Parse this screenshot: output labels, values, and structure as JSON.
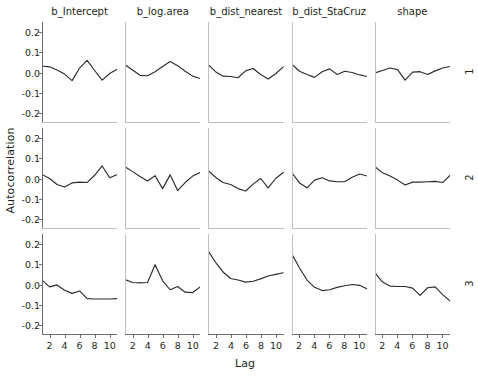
{
  "figure": {
    "ylabel": "Autocorrelation",
    "xlabel": "Lag",
    "line_color": "#2b2b2b",
    "axis_color": "#6d6d6d",
    "background": "#ffffff"
  },
  "axes": {
    "xticks": [
      2,
      4,
      6,
      8,
      10
    ],
    "xtick_labels": [
      "2",
      "4",
      "6",
      "8",
      "10"
    ],
    "xlim": [
      1,
      11
    ],
    "yticks": [
      0.2,
      0.1,
      0.0,
      -0.1,
      -0.2
    ],
    "ytick_labels": [
      "0.2",
      "0.1",
      "0.0",
      "-0.1",
      "-0.2"
    ],
    "ylim": [
      -0.25,
      0.25
    ]
  },
  "columns": [
    {
      "title": "b_Intercept"
    },
    {
      "title": "b_log.area"
    },
    {
      "title": "b_dist_nearest"
    },
    {
      "title": "b_dist_StaCruz"
    },
    {
      "title": "shape"
    }
  ],
  "rows": [
    {
      "label": "1"
    },
    {
      "label": "2"
    },
    {
      "label": "3"
    }
  ],
  "chart_data": {
    "type": "line",
    "title": "",
    "xlabel": "Lag",
    "ylabel": "Autocorrelation",
    "xlim": [
      1,
      11
    ],
    "ylim": [
      -0.25,
      0.25
    ],
    "grid": false,
    "legend": "none",
    "layout": "facet-grid 3 rows x 5 columns",
    "row_labels": [
      "1",
      "2",
      "3"
    ],
    "column_labels": [
      "b_Intercept",
      "b_log.area",
      "b_dist_nearest",
      "b_dist_StaCruz",
      "shape"
    ],
    "x": [
      1,
      2,
      3,
      4,
      5,
      6,
      7,
      8,
      9,
      10,
      11
    ],
    "panels": [
      {
        "row": "1",
        "column": "b_Intercept",
        "values": [
          0.032,
          0.028,
          0.012,
          -0.008,
          -0.04,
          0.022,
          0.06,
          0.01,
          -0.038,
          -0.005,
          0.016
        ]
      },
      {
        "row": "1",
        "column": "b_log.area",
        "values": [
          0.038,
          0.012,
          -0.014,
          -0.016,
          0.004,
          0.03,
          0.054,
          0.034,
          0.006,
          -0.018,
          -0.03
        ]
      },
      {
        "row": "1",
        "column": "b_dist_nearest",
        "values": [
          0.04,
          0.004,
          -0.018,
          -0.02,
          -0.026,
          0.008,
          0.02,
          -0.01,
          -0.032,
          -0.006,
          0.028
        ]
      },
      {
        "row": "1",
        "column": "b_dist_StaCruz",
        "values": [
          0.04,
          0.006,
          -0.01,
          -0.024,
          0.004,
          0.018,
          -0.01,
          0.006,
          0.0,
          -0.012,
          -0.02
        ]
      },
      {
        "row": "1",
        "column": "shape",
        "values": [
          -0.002,
          0.01,
          0.022,
          0.014,
          -0.038,
          0.002,
          0.004,
          -0.01,
          0.008,
          0.022,
          0.03
        ]
      },
      {
        "row": "2",
        "column": "b_Intercept",
        "values": [
          0.02,
          0.0,
          -0.03,
          -0.042,
          -0.022,
          -0.018,
          -0.02,
          0.016,
          0.062,
          0.004,
          0.02
        ]
      },
      {
        "row": "2",
        "column": "b_log.area",
        "values": [
          0.058,
          0.034,
          0.01,
          -0.012,
          0.014,
          -0.05,
          0.018,
          -0.06,
          -0.02,
          0.012,
          0.03
        ]
      },
      {
        "row": "2",
        "column": "b_dist_nearest",
        "values": [
          0.04,
          0.006,
          -0.02,
          -0.03,
          -0.05,
          -0.062,
          -0.028,
          0.0,
          -0.046,
          0.0,
          0.03
        ]
      },
      {
        "row": "2",
        "column": "b_dist_StaCruz",
        "values": [
          0.028,
          -0.022,
          -0.046,
          -0.008,
          0.004,
          -0.012,
          -0.016,
          -0.016,
          0.006,
          0.022,
          0.012
        ]
      },
      {
        "row": "2",
        "column": "shape",
        "values": [
          0.058,
          0.028,
          0.012,
          -0.008,
          -0.032,
          -0.018,
          -0.018,
          -0.016,
          -0.014,
          -0.02,
          0.016
        ]
      },
      {
        "row": "3",
        "column": "b_Intercept",
        "values": [
          0.022,
          -0.012,
          -0.002,
          -0.028,
          -0.044,
          -0.032,
          -0.07,
          -0.072,
          -0.072,
          -0.072,
          -0.07
        ]
      },
      {
        "row": "3",
        "column": "b_log.area",
        "values": [
          0.024,
          0.01,
          0.008,
          0.01,
          0.098,
          0.018,
          -0.026,
          -0.01,
          -0.038,
          -0.04,
          -0.012
        ]
      },
      {
        "row": "3",
        "column": "b_dist_nearest",
        "values": [
          0.168,
          0.11,
          0.062,
          0.03,
          0.022,
          0.012,
          0.016,
          0.028,
          0.042,
          0.05,
          0.058
        ]
      },
      {
        "row": "3",
        "column": "b_dist_StaCruz",
        "values": [
          0.15,
          0.082,
          0.022,
          -0.014,
          -0.03,
          -0.026,
          -0.014,
          -0.006,
          0.0,
          -0.004,
          -0.022
        ]
      },
      {
        "row": "3",
        "column": "shape",
        "values": [
          0.058,
          0.012,
          -0.008,
          -0.01,
          -0.01,
          -0.018,
          -0.054,
          -0.016,
          -0.012,
          -0.05,
          -0.082
        ]
      }
    ]
  }
}
